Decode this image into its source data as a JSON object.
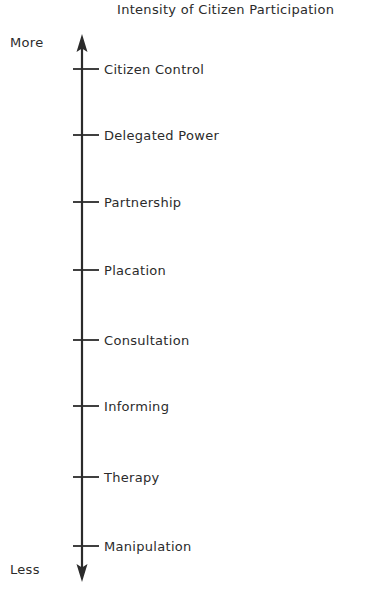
{
  "chart_data": {
    "type": "table",
    "title": "Intensity of Citizen Participation",
    "xlabel": "",
    "ylabel": "",
    "orientation": "vertical-axis-arrow",
    "grid": false,
    "legend": null,
    "axis_endpoints": {
      "top_label": "More",
      "bottom_label": "Less"
    },
    "axis_range": [
      1,
      8
    ],
    "categories": [
      "Citizen Control",
      "Delegated Power",
      "Partnership",
      "Placation",
      "Consultation",
      "Informing",
      "Therapy",
      "Manipulation"
    ],
    "values": [
      8,
      7,
      6,
      5,
      4,
      3,
      2,
      1
    ],
    "annotations": [
      "More",
      "Less"
    ],
    "colors": {
      "ink": "#2b2b2b",
      "background": "#ffffff"
    }
  },
  "figure": {
    "title": "Intensity of Citizen Participation",
    "top_end_label": "More",
    "bottom_end_label": "Less",
    "rungs": [
      {
        "label": "Citizen Control",
        "y": 69
      },
      {
        "label": "Delegated Power",
        "y": 135
      },
      {
        "label": "Partnership",
        "y": 202
      },
      {
        "label": "Placation",
        "y": 270
      },
      {
        "label": "Consultation",
        "y": 340
      },
      {
        "label": "Informing",
        "y": 406
      },
      {
        "label": "Therapy",
        "y": 477
      },
      {
        "label": "Manipulation",
        "y": 546
      }
    ]
  }
}
